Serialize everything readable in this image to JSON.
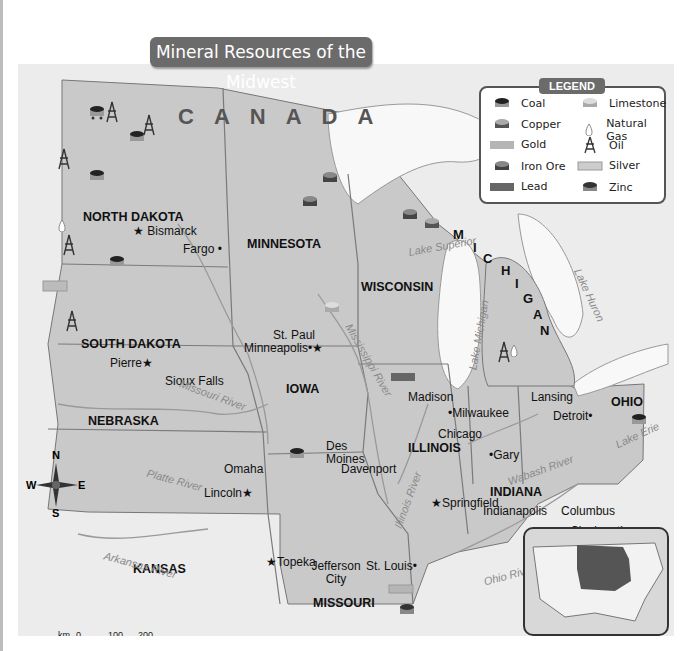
{
  "title": "Mineral Resources of the Midwest",
  "country_label": "CANADA",
  "legend": {
    "title": "LEGEND",
    "items": [
      {
        "label": "Coal",
        "icon": "coal-cart-icon"
      },
      {
        "label": "Copper",
        "icon": "copper-cart-icon"
      },
      {
        "label": "Gold",
        "icon": "gold-bar-icon"
      },
      {
        "label": "Iron Ore",
        "icon": "iron-ore-cart-icon"
      },
      {
        "label": "Lead",
        "icon": "lead-bar-icon"
      },
      {
        "label": "Limestone",
        "icon": "limestone-cart-icon"
      },
      {
        "label": "Natural Gas",
        "icon": "natural-gas-flame-icon"
      },
      {
        "label": "Oil",
        "icon": "oil-derrick-icon"
      },
      {
        "label": "Silver",
        "icon": "silver-bar-icon"
      },
      {
        "label": "Zinc",
        "icon": "zinc-cart-icon"
      }
    ]
  },
  "states": {
    "north_dakota": "NORTH DAKOTA",
    "south_dakota": "SOUTH DAKOTA",
    "nebraska": "NEBRASKA",
    "kansas": "KANSAS",
    "minnesota": "MINNESOTA",
    "iowa": "IOWA",
    "missouri": "MISSOURI",
    "wisconsin": "WISCONSIN",
    "illinois": "ILLINOIS",
    "michigan": "MICHIGAN",
    "indiana": "INDIANA",
    "ohio": "OHIO"
  },
  "cities": {
    "bismarck": "Bismarck",
    "fargo": "Fargo",
    "pierre": "Pierre",
    "sioux_falls": "Sioux Falls",
    "st_paul": "St. Paul",
    "minneapolis": "Minneapolis",
    "madison": "Madison",
    "milwaukee": "Milwaukee",
    "lansing": "Lansing",
    "detroit": "Detroit",
    "chicago": "Chicago",
    "gary": "Gary",
    "des_moines": "Des Moines",
    "davenport": "Davenport",
    "omaha": "Omaha",
    "lincoln": "Lincoln",
    "indianapolis": "Indianapolis",
    "columbus": "Columbus",
    "cincinnati": "Cincinnati",
    "springfield": "Springfield",
    "topeka": "Topeka",
    "jefferson_city": "Jefferson City",
    "st_louis": "St. Louis",
    "wichita": "Wichita"
  },
  "water": {
    "lake_superior": "Lake Superior",
    "lake_michigan": "Lake Michigan",
    "lake_huron": "Lake Huron",
    "lake_erie": "Lake Erie",
    "mississippi_river": "Mississippi River",
    "missouri_river": "Missouri River",
    "platte_river": "Platte River",
    "illinois_river": "Illinois River",
    "wabash_river": "Wabash River",
    "ohio_river": "Ohio River",
    "arkansas_river": "Arkansas River"
  },
  "compass": {
    "n": "N",
    "s": "S",
    "e": "E",
    "w": "W"
  },
  "scale": {
    "km_label": "km",
    "km_0": "0",
    "km_100": "100",
    "km_200": "200",
    "mi_label": "mi",
    "mi_0": "0",
    "mi_100": "100",
    "mi_200": "200"
  },
  "colors": {
    "midwest_fill": "#c8c8c8",
    "outside_fill": "#eeeeee",
    "water": "#f7f7f7",
    "title_bg": "#6b6b6b",
    "inset_highlight": "#555555"
  }
}
